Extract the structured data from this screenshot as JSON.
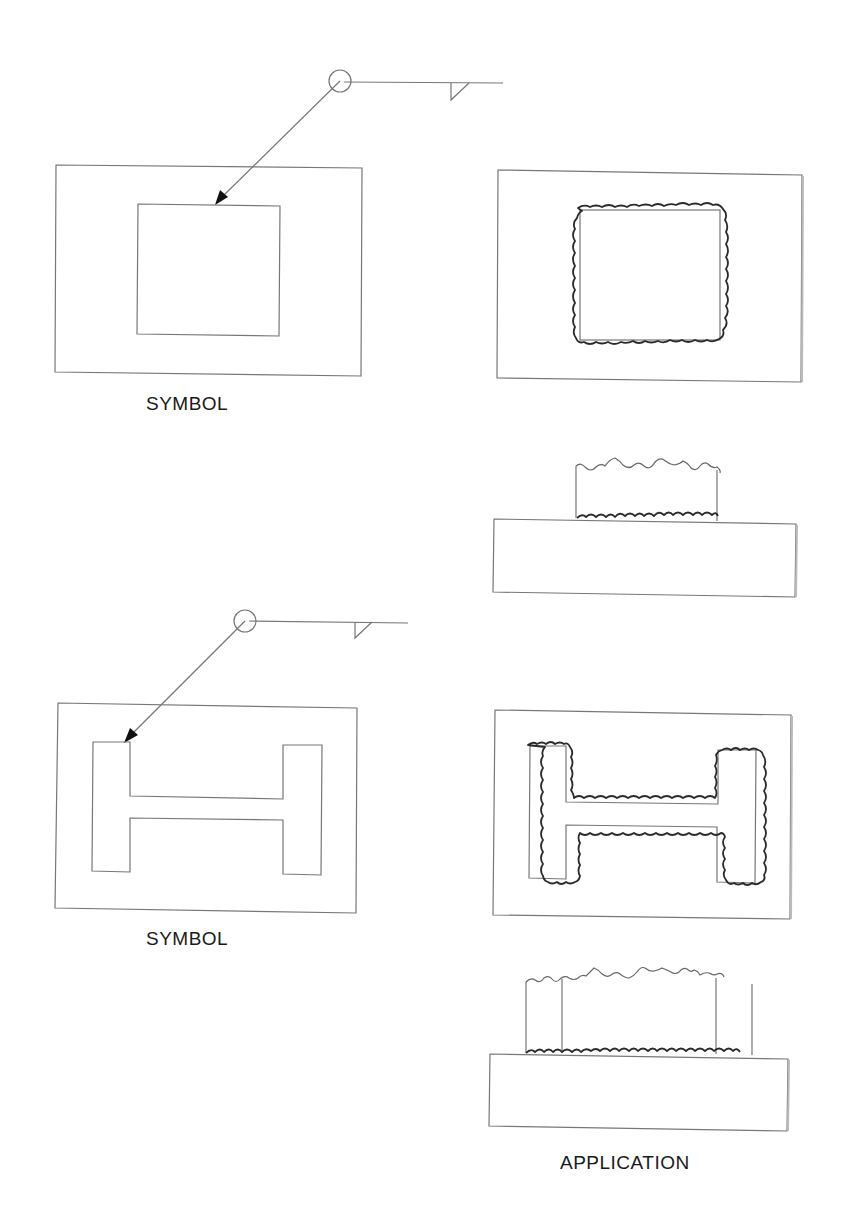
{
  "diagram": {
    "labels": {
      "symbol_top": "SYMBOL",
      "symbol_bottom": "SYMBOL",
      "application": "APPLICATION"
    },
    "colors": {
      "line": "#777777",
      "weld_bead": "#2a2a2a",
      "arrowhead": "#111111",
      "text": "#1a1a1a",
      "background": "#ffffff"
    },
    "examples": [
      {
        "name": "square-tube",
        "symbol": {
          "weld_all_around_circle": true,
          "weld_type": "fillet",
          "arrow_side": true
        },
        "application_views": [
          "plan-view",
          "side-view"
        ]
      },
      {
        "name": "h-beam",
        "symbol": {
          "weld_all_around_circle": true,
          "weld_type": "fillet",
          "arrow_side": true
        },
        "application_views": [
          "plan-view",
          "side-view"
        ]
      }
    ]
  }
}
